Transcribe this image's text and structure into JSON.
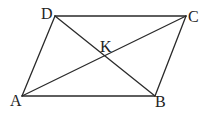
{
  "diagram": {
    "type": "parallelogram-with-diagonals",
    "vertices": {
      "A": {
        "label": "A",
        "x": 22,
        "y": 96
      },
      "B": {
        "label": "B",
        "x": 155,
        "y": 96
      },
      "C": {
        "label": "C",
        "x": 186,
        "y": 16
      },
      "D": {
        "label": "D",
        "x": 55,
        "y": 16
      },
      "K": {
        "label": "K",
        "x": 106,
        "y": 57
      }
    },
    "edges": [
      "AB",
      "BC",
      "CD",
      "DA"
    ],
    "diagonals": [
      "AC",
      "BD"
    ],
    "intersection": "K",
    "line_color": "#2a2a2a"
  }
}
